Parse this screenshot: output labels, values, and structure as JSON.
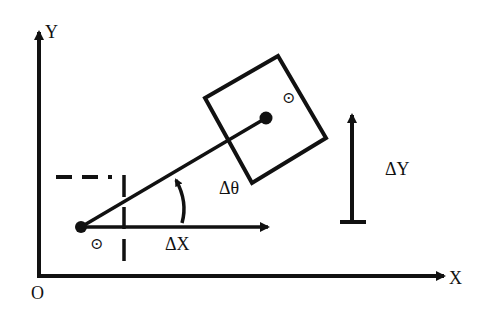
{
  "diagram": {
    "type": "robot-pose-transform",
    "axes": {
      "origin_label": "O",
      "x_label": "X",
      "y_label": "Y"
    },
    "labels": {
      "delta_x": "ΔX",
      "delta_y": "ΔY",
      "delta_theta": "Δθ",
      "start_center_symbol": "⊙",
      "end_center_symbol": "⊙"
    },
    "colors": {
      "stroke": "#111111",
      "background": "#ffffff"
    }
  }
}
